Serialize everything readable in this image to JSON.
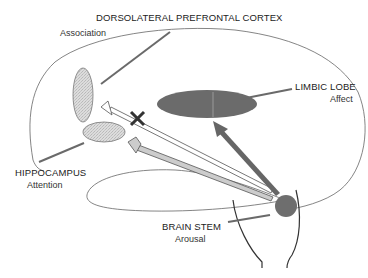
{
  "diagram": {
    "regions": [
      {
        "id": "dlpfc",
        "label": "DORSOLATERAL PREFRONTAL CORTEX",
        "function": "Association"
      },
      {
        "id": "limbic",
        "label": "LIMBIC LOBE",
        "function": "Affect"
      },
      {
        "id": "hippocampus",
        "label": "HIPPOCAMPUS",
        "function": "Attention"
      },
      {
        "id": "brainstem",
        "label": "BRAIN STEM",
        "function": "Arousal"
      }
    ],
    "arrows": [
      {
        "from": "brainstem",
        "to": "limbic",
        "style": "dark-gray solid"
      },
      {
        "from": "brainstem",
        "to": "hippocampus",
        "style": "light-gray outlined"
      },
      {
        "from": "brainstem",
        "to": "dlpfc",
        "style": "white outlined",
        "blocked": true
      }
    ],
    "block_marker": "X",
    "colors": {
      "limbic_fill": "#6b6b6b",
      "dlpfc_fill": "#d6d6d6",
      "hippocampus_fill": "#cfcfcf",
      "brainstem_fill": "#6e6e6e",
      "outline": "#555555",
      "leader_line": "#6a6a6a"
    }
  }
}
